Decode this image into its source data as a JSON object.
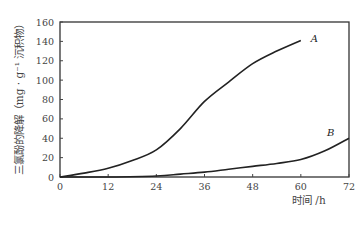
{
  "chart_data": {
    "type": "line",
    "title": "",
    "xlabel": "时间 /h",
    "ylabel": "三氯酚的降解（mg · g⁻¹ 沉积物）",
    "xlim": [
      0,
      72
    ],
    "ylim": [
      0,
      160
    ],
    "xticks": [
      0,
      12,
      24,
      36,
      48,
      60,
      72
    ],
    "yticks": [
      0,
      20,
      40,
      60,
      80,
      100,
      120,
      140,
      160
    ],
    "grid": false,
    "legend": "inline labels at curve ends",
    "series": [
      {
        "name": "A",
        "x": [
          0,
          6,
          12,
          18,
          24,
          30,
          36,
          42,
          48,
          54,
          60
        ],
        "values": [
          0,
          4,
          9,
          17,
          28,
          50,
          78,
          98,
          117,
          130,
          141
        ]
      },
      {
        "name": "B",
        "x": [
          0,
          12,
          24,
          30,
          36,
          42,
          48,
          54,
          60,
          66,
          72
        ],
        "values": [
          0,
          0,
          1,
          3,
          5,
          8,
          11,
          14,
          18,
          27,
          40
        ]
      }
    ]
  },
  "labels": {
    "ylabel": "三氯酚的降解（mg · g⁻¹ 沉积物）",
    "xlabel": "时间 /h",
    "seriesA": "A",
    "seriesB": "B"
  }
}
